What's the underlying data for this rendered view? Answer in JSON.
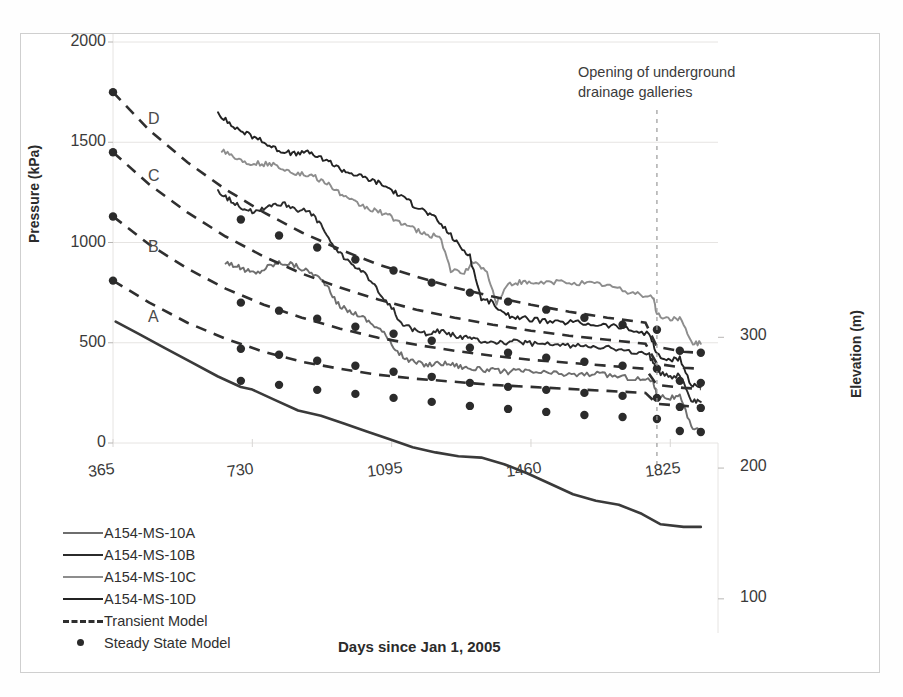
{
  "figure": {
    "annotation": {
      "line1": "Opening of underground",
      "line2": "drainage galleries"
    },
    "curve_tags": [
      {
        "label": "D",
        "x": 148,
        "y": 110
      },
      {
        "label": "C",
        "x": 148,
        "y": 167
      },
      {
        "label": "B",
        "x": 148,
        "y": 238
      },
      {
        "label": "A",
        "x": 148,
        "y": 308
      }
    ]
  },
  "legend": {
    "items": [
      {
        "label": "A154-MS-10A",
        "style": "solid",
        "color": "#6e6e6e"
      },
      {
        "label": "A154-MS-10B",
        "style": "solid",
        "color": "#2b2b2b"
      },
      {
        "label": "A154-MS-10C",
        "style": "solid",
        "color": "#8d8d8d"
      },
      {
        "label": "A154-MS-10D",
        "style": "solid",
        "color": "#232323"
      },
      {
        "label": "Transient Model",
        "style": "dashed",
        "color": "#2f2f2f"
      },
      {
        "label": "Steady State Model",
        "style": "dot",
        "color": "#2b2b2b"
      }
    ]
  },
  "chart_data": {
    "type": "line",
    "title": "",
    "xlabel": "Days since Jan 1, 2005",
    "ylabel": "Pressure (kPa)",
    "y2label": "Elevation (m)",
    "xlim": [
      365,
      1950
    ],
    "ylim": [
      0,
      2000
    ],
    "y2lim": [
      80,
      340
    ],
    "xticks": [
      365,
      730,
      1095,
      1460,
      1825
    ],
    "yticks": [
      0,
      500,
      1000,
      1500,
      2000
    ],
    "y2ticks": [
      100,
      200,
      300
    ],
    "grid": "horizontal-light",
    "legend_position": "lower-left",
    "annotations": [
      {
        "text": "Opening of underground drainage galleries",
        "x": 1790,
        "type": "vline-dashed"
      }
    ],
    "series": [
      {
        "name": "A154-MS-10A",
        "style": "solid",
        "color": "#6e6e6e",
        "x": [
          660,
          690,
          715,
          740,
          770,
          800,
          830,
          860,
          890,
          920,
          950,
          980,
          1010,
          1040,
          1070,
          1100,
          1130,
          1160,
          1190,
          1220,
          1250,
          1280,
          1310,
          1340,
          1370,
          1400,
          1430,
          1460,
          1500,
          1540,
          1580,
          1620,
          1660,
          1700,
          1740,
          1780,
          1790,
          1820,
          1850,
          1880,
          1905
        ],
        "y": [
          905,
          880,
          860,
          845,
          880,
          900,
          895,
          870,
          845,
          800,
          700,
          660,
          640,
          600,
          560,
          480,
          420,
          400,
          390,
          400,
          395,
          380,
          370,
          365,
          360,
          355,
          360,
          355,
          350,
          345,
          340,
          345,
          340,
          330,
          320,
          310,
          240,
          225,
          230,
          80,
          70
        ]
      },
      {
        "name": "A154-MS-10B",
        "style": "solid",
        "color": "#2b2b2b",
        "x": [
          640,
          670,
          700,
          730,
          760,
          790,
          820,
          850,
          880,
          910,
          940,
          970,
          1000,
          1030,
          1060,
          1090,
          1120,
          1150,
          1180,
          1210,
          1240,
          1270,
          1300,
          1330,
          1360,
          1390,
          1420,
          1450,
          1490,
          1530,
          1570,
          1610,
          1650,
          1690,
          1730,
          1770,
          1790,
          1820,
          1850,
          1880,
          1905
        ],
        "y": [
          1260,
          1215,
          1180,
          1150,
          1175,
          1195,
          1190,
          1165,
          1150,
          1090,
          980,
          930,
          880,
          830,
          760,
          690,
          600,
          565,
          545,
          560,
          550,
          530,
          520,
          510,
          505,
          500,
          505,
          500,
          490,
          490,
          485,
          490,
          480,
          465,
          450,
          440,
          355,
          330,
          340,
          215,
          205
        ]
      },
      {
        "name": "A154-MS-10C",
        "style": "solid",
        "color": "#8d8d8d",
        "x": [
          650,
          680,
          710,
          740,
          770,
          800,
          830,
          860,
          890,
          920,
          950,
          980,
          1010,
          1040,
          1070,
          1100,
          1130,
          1160,
          1190,
          1220,
          1250,
          1280,
          1310,
          1340,
          1370,
          1400,
          1430,
          1460,
          1500,
          1540,
          1580,
          1620,
          1660,
          1700,
          1740,
          1780,
          1790,
          1820,
          1850,
          1880,
          1905
        ],
        "y": [
          1465,
          1430,
          1400,
          1395,
          1390,
          1380,
          1355,
          1340,
          1330,
          1300,
          1260,
          1215,
          1190,
          1165,
          1150,
          1120,
          1090,
          1060,
          1030,
          1040,
          860,
          845,
          900,
          870,
          700,
          790,
          800,
          795,
          800,
          805,
          800,
          795,
          790,
          760,
          745,
          730,
          640,
          620,
          625,
          500,
          495
        ]
      },
      {
        "name": "A154-MS-10D",
        "style": "solid",
        "color": "#232323",
        "x": [
          640,
          670,
          700,
          730,
          760,
          790,
          820,
          850,
          880,
          910,
          940,
          970,
          1000,
          1030,
          1060,
          1090,
          1120,
          1150,
          1180,
          1210,
          1240,
          1270,
          1300,
          1330,
          1360,
          1390,
          1420,
          1450,
          1490,
          1530,
          1570,
          1610,
          1650,
          1690,
          1730,
          1770,
          1790,
          1820,
          1850,
          1880,
          1905
        ],
        "y": [
          1650,
          1590,
          1560,
          1530,
          1500,
          1470,
          1450,
          1440,
          1450,
          1420,
          1390,
          1360,
          1340,
          1320,
          1300,
          1270,
          1230,
          1190,
          1160,
          1120,
          1060,
          990,
          930,
          720,
          700,
          640,
          630,
          620,
          610,
          600,
          605,
          595,
          590,
          580,
          560,
          545,
          440,
          410,
          420,
          290,
          280
        ]
      },
      {
        "name": "Transient Model A",
        "style": "dashed",
        "color": "#2f2f2f",
        "x": [
          365,
          460,
          560,
          660,
          760,
          860,
          960,
          1060,
          1160,
          1260,
          1360,
          1460,
          1560,
          1660,
          1760,
          1790,
          1860,
          1905
        ],
        "y": [
          810,
          700,
          600,
          520,
          455,
          405,
          370,
          340,
          320,
          305,
          290,
          280,
          270,
          260,
          250,
          195,
          185,
          180
        ]
      },
      {
        "name": "Transient Model B",
        "style": "dashed",
        "color": "#2f2f2f",
        "x": [
          365,
          460,
          560,
          660,
          760,
          860,
          960,
          1060,
          1160,
          1260,
          1360,
          1460,
          1560,
          1660,
          1760,
          1790,
          1860,
          1905
        ],
        "y": [
          1130,
          990,
          870,
          770,
          690,
          625,
          570,
          525,
          490,
          460,
          435,
          415,
          400,
          385,
          370,
          290,
          275,
          270
        ]
      },
      {
        "name": "Transient Model C",
        "style": "dashed",
        "color": "#2f2f2f",
        "x": [
          365,
          460,
          560,
          660,
          760,
          860,
          960,
          1060,
          1160,
          1260,
          1360,
          1460,
          1560,
          1660,
          1760,
          1790,
          1860,
          1905
        ],
        "y": [
          1450,
          1290,
          1150,
          1030,
          930,
          845,
          775,
          715,
          665,
          625,
          590,
          560,
          535,
          515,
          495,
          395,
          375,
          370
        ]
      },
      {
        "name": "Transient Model D",
        "style": "dashed",
        "color": "#2f2f2f",
        "x": [
          365,
          460,
          560,
          660,
          760,
          860,
          960,
          1060,
          1160,
          1260,
          1360,
          1460,
          1560,
          1660,
          1760,
          1790,
          1860,
          1905
        ],
        "y": [
          1750,
          1560,
          1400,
          1265,
          1150,
          1050,
          965,
          890,
          830,
          775,
          730,
          690,
          655,
          625,
          600,
          480,
          455,
          450
        ]
      },
      {
        "name": "Steady State Model A",
        "style": "points",
        "color": "#2b2b2b",
        "x": [
          365,
          700,
          800,
          900,
          1000,
          1100,
          1200,
          1300,
          1400,
          1500,
          1600,
          1700,
          1790,
          1850,
          1905
        ],
        "y": [
          810,
          310,
          290,
          265,
          245,
          225,
          205,
          185,
          170,
          155,
          140,
          130,
          120,
          60,
          55
        ]
      },
      {
        "name": "Steady State Model B",
        "style": "points",
        "color": "#2b2b2b",
        "x": [
          365,
          700,
          800,
          900,
          1000,
          1100,
          1200,
          1300,
          1400,
          1500,
          1600,
          1700,
          1790,
          1850,
          1905
        ],
        "y": [
          1130,
          470,
          440,
          410,
          385,
          355,
          330,
          300,
          280,
          265,
          250,
          235,
          225,
          180,
          175
        ]
      },
      {
        "name": "Steady State Model C",
        "style": "points",
        "color": "#2b2b2b",
        "x": [
          365,
          700,
          800,
          900,
          1000,
          1100,
          1200,
          1300,
          1400,
          1500,
          1600,
          1700,
          1790,
          1850,
          1905
        ],
        "y": [
          1450,
          700,
          660,
          620,
          580,
          545,
          510,
          475,
          450,
          425,
          405,
          385,
          370,
          310,
          300
        ]
      },
      {
        "name": "Steady State Model D",
        "style": "points",
        "color": "#2b2b2b",
        "x": [
          365,
          700,
          800,
          900,
          1000,
          1100,
          1200,
          1300,
          1400,
          1500,
          1600,
          1700,
          1790,
          1850,
          1905
        ],
        "y": [
          1750,
          1115,
          1035,
          975,
          915,
          860,
          800,
          750,
          705,
          665,
          625,
          590,
          565,
          460,
          450
        ]
      },
      {
        "name": "Elevation",
        "style": "solid",
        "color": "#3a3a3a",
        "axis": "y2",
        "x": [
          372,
          430,
          500,
          570,
          640,
          700,
          730,
          790,
          850,
          910,
          970,
          1030,
          1090,
          1150,
          1210,
          1270,
          1330,
          1390,
          1450,
          1510,
          1570,
          1630,
          1690,
          1750,
          1800,
          1860,
          1905
        ],
        "y": [
          312,
          303,
          292,
          281,
          270,
          262,
          260,
          252,
          244,
          240,
          234,
          228,
          222,
          216,
          212,
          209,
          208,
          203,
          196,
          188,
          180,
          175,
          172,
          165,
          157,
          155,
          155
        ]
      }
    ]
  }
}
